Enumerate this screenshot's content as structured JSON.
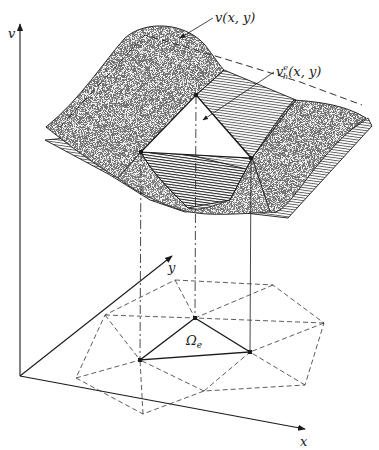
{
  "figure": {
    "type": "finite-element-approximation-diagram",
    "labels": {
      "exact_surface": "v(x, y)",
      "approx_surface_base": "v",
      "approx_surface_super": "e",
      "approx_surface_sub": "h",
      "approx_surface_args": "(x, y)",
      "element": "Ω",
      "element_sub": "e",
      "axis_v": "v",
      "axis_x": "x",
      "axis_y": "y"
    },
    "colors": {
      "ink": "#1a1a1a",
      "background": "#ffffff",
      "stipple": "#2a2a2a"
    },
    "nodes_3d": [
      {
        "id": "top",
        "x": 196,
        "y": 95
      },
      {
        "id": "left",
        "x": 141,
        "y": 152
      },
      {
        "id": "right",
        "x": 251,
        "y": 158
      }
    ],
    "mesh_nodes": [
      {
        "id": "A",
        "x": 195,
        "y": 318
      },
      {
        "id": "B",
        "x": 140,
        "y": 360
      },
      {
        "id": "C",
        "x": 250,
        "y": 352
      }
    ]
  }
}
